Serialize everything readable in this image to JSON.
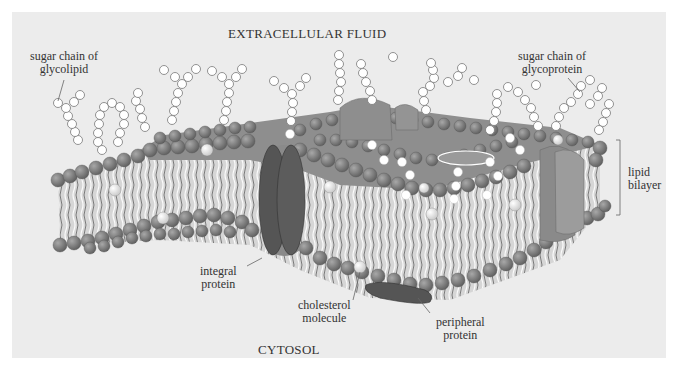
{
  "diagram": {
    "regions": {
      "top": "EXTRACELLULAR FLUID",
      "bottom": "CYTOSOL"
    },
    "labels": {
      "glycolipid_chain": [
        "sugar chain of",
        "glycolipid"
      ],
      "glycoprotein_chain": [
        "sugar chain of",
        "glycoprotein"
      ],
      "lipid_bilayer": [
        "lipid",
        "bilayer"
      ],
      "integral_protein": [
        "integral",
        "protein"
      ],
      "cholesterol": [
        "cholesterol",
        "molecule"
      ],
      "peripheral_protein": [
        "peripheral",
        "protein"
      ]
    },
    "colors": {
      "background": "#ececec",
      "phospholipid_head": "#7a7a7a",
      "phospholipid_head_highlight": "#9a9a9a",
      "protein_dark": "#555555",
      "protein_mid": "#8a8a8a",
      "cholesterol": "#e6e6e6",
      "sugar": "#ffffff",
      "text": "#333333"
    }
  }
}
